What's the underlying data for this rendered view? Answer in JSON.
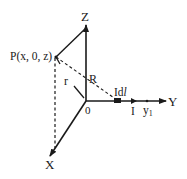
{
  "diagram": {
    "title": "",
    "colors": {
      "ink": "#1a1a1a",
      "background": "#ffffff"
    },
    "axes": {
      "z_label": "Z",
      "y_label": "Y",
      "x_label": "X",
      "origin_label": "0"
    },
    "point_label": "P(x, 0, z)",
    "r_label": "r",
    "R_label": "R",
    "element_label_prefix": "Id",
    "element_label_italic": "l",
    "current_label": "I",
    "y1_label": "y",
    "y1_subscript": "1"
  }
}
